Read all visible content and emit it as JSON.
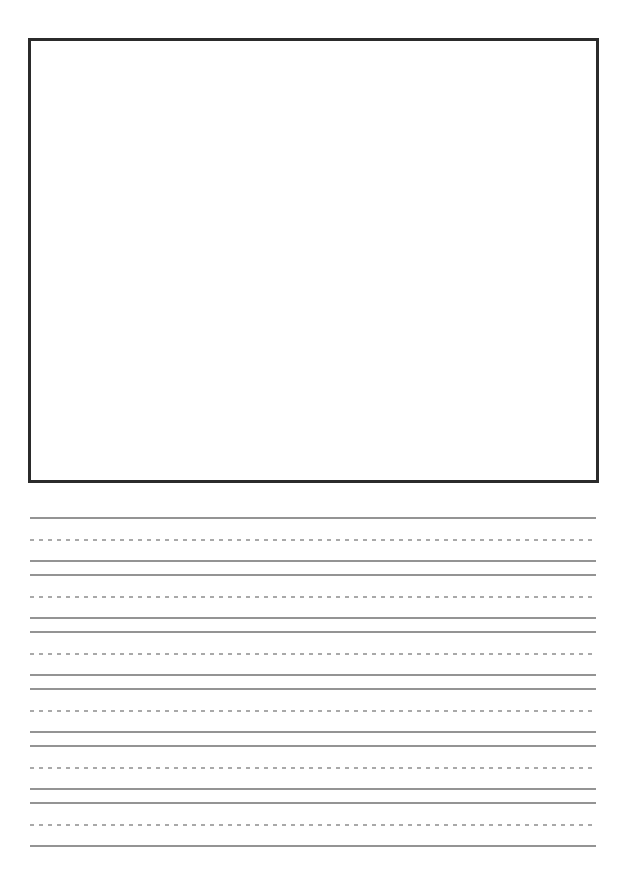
{
  "document": {
    "type": "primary-writing-worksheet",
    "description": "Blank story paper: drawing box on top, handwriting guide lines below",
    "visible_text": ""
  },
  "drawing_box": {
    "border_color": "#2b2b2b"
  },
  "writing_area": {
    "row_count": 6,
    "lines_per_row": [
      "solid-top",
      "dashed-middle",
      "solid-baseline"
    ],
    "solid_line_color": "#949494",
    "dashed_line_color": "#a9a9a9"
  }
}
